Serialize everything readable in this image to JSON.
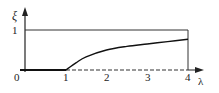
{
  "chart_data": {
    "type": "line",
    "title": "",
    "xlabel": "λ",
    "ylabel": "ξ",
    "xlim": [
      0,
      4
    ],
    "ylim": [
      0,
      1
    ],
    "x_ticks": [
      "0",
      "1",
      "2",
      "3",
      "4"
    ],
    "y_ticks": [
      "1"
    ],
    "grid": false,
    "legend": null,
    "series": [
      {
        "name": "ξ(λ) curve",
        "style": "solid",
        "x": [
          1,
          1.25,
          1.5,
          2,
          2.5,
          3,
          3.5,
          4
        ],
        "y": [
          0,
          0.18,
          0.33,
          0.5,
          0.59,
          0.65,
          0.71,
          0.77
        ]
      },
      {
        "name": "ξ = 0 (solid, 0 ≤ λ ≤ 1)",
        "style": "solid",
        "x": [
          0,
          1
        ],
        "y": [
          0,
          0
        ]
      },
      {
        "name": "ξ = 0 (dashed, 1 ≤ λ ≤ 4)",
        "style": "dashed",
        "x": [
          1,
          4
        ],
        "y": [
          0,
          0
        ]
      },
      {
        "name": "upper bound ξ = 1",
        "style": "solid",
        "x": [
          0,
          4
        ],
        "y": [
          1,
          1
        ]
      },
      {
        "name": "right bound λ = 4",
        "style": "solid",
        "x": [
          4,
          4
        ],
        "y": [
          0,
          1
        ]
      }
    ]
  },
  "labels": {
    "y_axis": "ξ",
    "x_axis": "λ",
    "origin": "0",
    "y_one": "1",
    "x1": "1",
    "x2": "2",
    "x3": "3",
    "x4": "4"
  }
}
